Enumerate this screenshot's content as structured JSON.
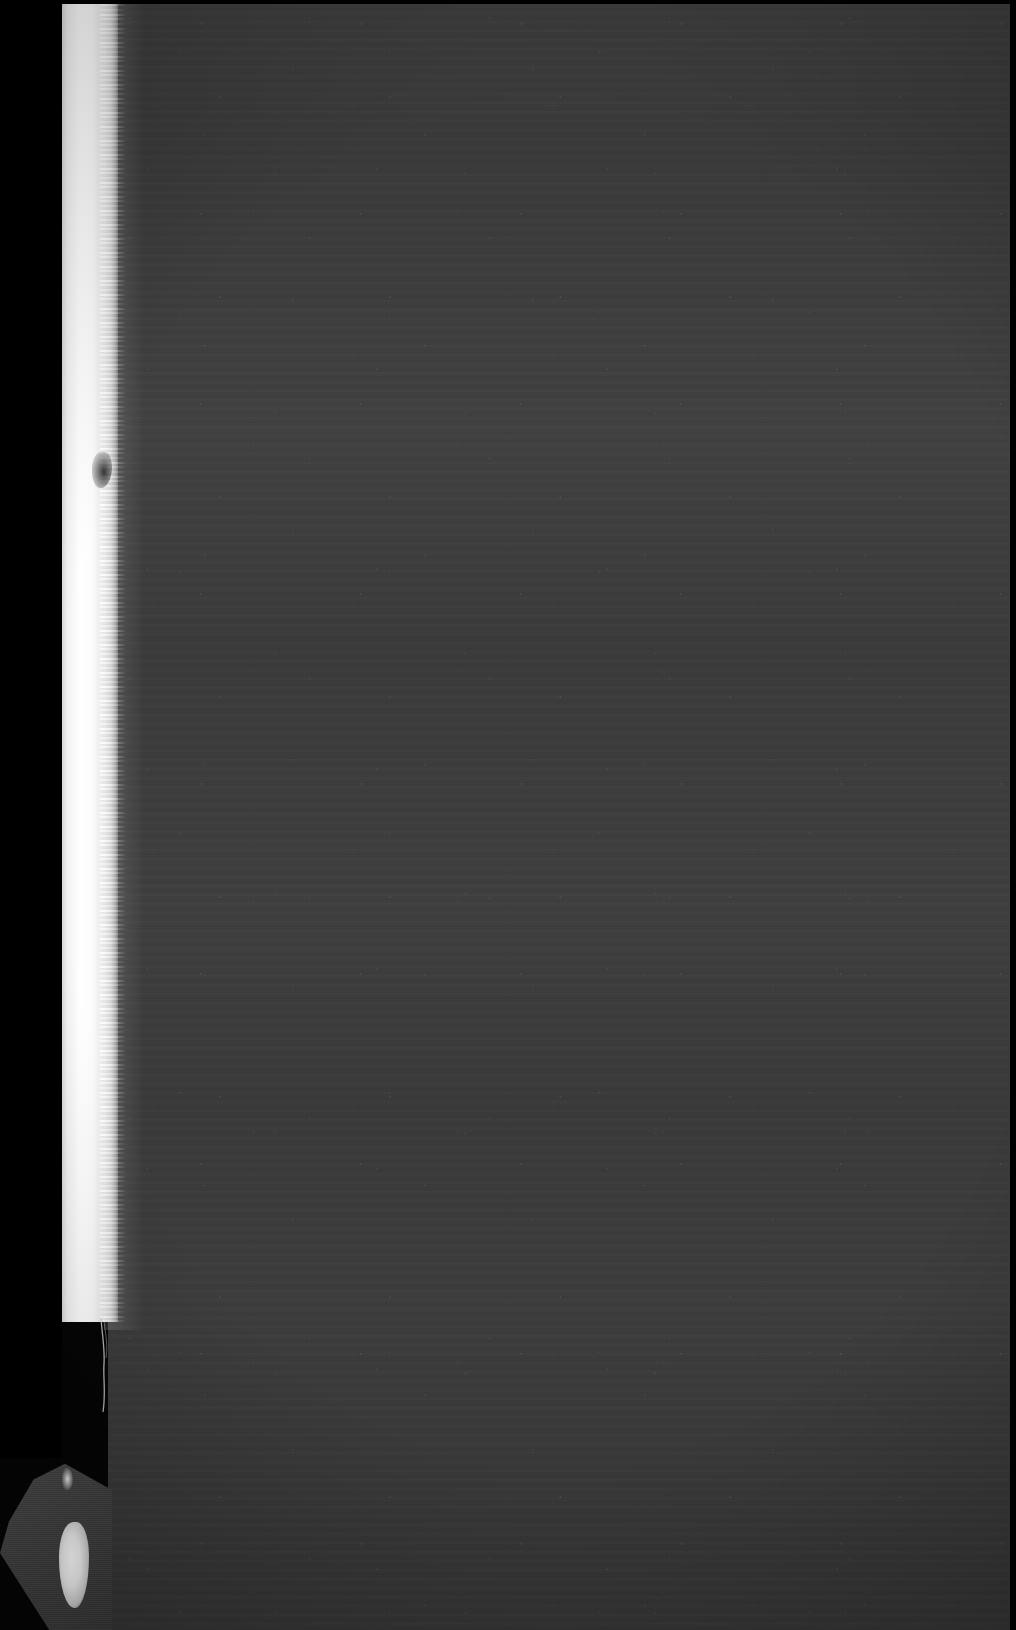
{
  "scan": {
    "width": 1016,
    "height": 1630,
    "caption": "",
    "subject_label": "",
    "notes": ""
  },
  "regions": {
    "backdrop_label": "",
    "cover_label": "",
    "page_edge_label": "",
    "corner_fragment_label": "",
    "puff_label": ""
  },
  "colors": {
    "backdrop": "#050505",
    "cover_dark": "#343434",
    "cover_mid": "#3c3c3c",
    "cover_light": "#414141",
    "page_edge_white": "#ffffff",
    "page_edge_shadow": "#6a6a6a",
    "fragment_gray": "#4a4a4a",
    "border_black": "#000000"
  }
}
